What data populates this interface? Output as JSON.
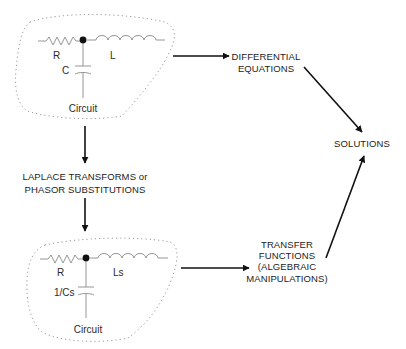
{
  "diagram": {
    "top_circuit": {
      "resistor_label": "R",
      "inductor_label": "L",
      "capacitor_label": "C",
      "caption": "Circuit"
    },
    "bottom_circuit": {
      "resistor_label": "R",
      "inductor_label": "Ls",
      "capacitor_label": "1/Cs",
      "caption": "Circuit"
    },
    "differential_equations": {
      "line1": "DIFFERENTIAL",
      "line2": "EQUATIONS"
    },
    "transform_step": {
      "line1": "LAPLACE TRANSFORMS or",
      "line2": "PHASOR SUBSTITUTIONS"
    },
    "transfer_functions": {
      "line1": "TRANSFER",
      "line2": "FUNCTIONS",
      "line3": "(ALGEBRAIC",
      "line4": "MANIPULATIONS)"
    },
    "solutions": {
      "label": "SOLUTIONS"
    },
    "colors": {
      "text": "#1c1c1c",
      "arrow": "#111111",
      "circuit_wire": "#8a8a8a",
      "boundary": "#9a9a9a"
    }
  }
}
